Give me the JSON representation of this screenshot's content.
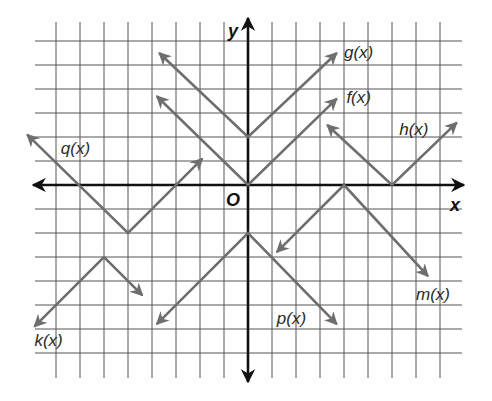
{
  "chart_data": {
    "type": "line",
    "title": "",
    "xlabel": "x",
    "ylabel": "y",
    "origin_label": "O",
    "grid": true,
    "xlim": [
      -8,
      8
    ],
    "ylim": [
      -7,
      6
    ],
    "unit_px": 24,
    "origin_px": [
      248,
      185
    ],
    "colors": {
      "grid": "#555555",
      "axis": "#111111",
      "curve": "#6e6e6e"
    },
    "series": [
      {
        "name": "g(x)",
        "equation": "|x| + 2",
        "vertex": [
          0,
          2
        ],
        "opens": "up",
        "points": [
          [
            -3.7,
            5.5
          ],
          [
            0,
            2
          ],
          [
            3.7,
            5.5
          ]
        ],
        "label_pos": [
          4.0,
          5.3
        ]
      },
      {
        "name": "f(x)",
        "equation": "|x|",
        "vertex": [
          0,
          0
        ],
        "opens": "up",
        "points": [
          [
            -3.8,
            3.7
          ],
          [
            0,
            0
          ],
          [
            3.7,
            3.6
          ]
        ],
        "label_pos": [
          4.1,
          3.4
        ]
      },
      {
        "name": "h(x)",
        "equation": "|x - 6|",
        "vertex": [
          6,
          0
        ],
        "opens": "up",
        "points": [
          [
            3.3,
            2.5
          ],
          [
            6,
            0
          ],
          [
            8.7,
            2.6
          ]
        ],
        "label_pos": [
          6.3,
          2.1
        ]
      },
      {
        "name": "q(x)",
        "equation": "|x + 5| - 2",
        "vertex": [
          -5,
          -2
        ],
        "opens": "up",
        "points": [
          [
            -9.2,
            2.1
          ],
          [
            -5,
            -2
          ],
          [
            -1.9,
            1.1
          ]
        ],
        "label_pos": [
          -7.8,
          1.3
        ]
      },
      {
        "name": "k(x)",
        "equation": "-|x + 6| - 3",
        "vertex": [
          -6,
          -3
        ],
        "opens": "down",
        "points": [
          [
            -8.9,
            -5.9
          ],
          [
            -6,
            -3
          ],
          [
            -4.4,
            -4.6
          ]
        ],
        "label_pos": [
          -8.9,
          -6.7
        ]
      },
      {
        "name": "p(x)",
        "equation": "-|x| - 2",
        "vertex": [
          0,
          -2
        ],
        "opens": "down",
        "points": [
          [
            -3.8,
            -5.8
          ],
          [
            0,
            -2
          ],
          [
            3.7,
            -5.8
          ]
        ],
        "label_pos": [
          1.2,
          -5.8
        ]
      },
      {
        "name": "m(x)",
        "equation": "-|x - 4|",
        "vertex": [
          4,
          0
        ],
        "opens": "down",
        "points": [
          [
            1.2,
            -2.8
          ],
          [
            4,
            0
          ],
          [
            7.5,
            -3.8
          ]
        ],
        "label_pos": [
          7.0,
          -4.8
        ]
      }
    ]
  }
}
